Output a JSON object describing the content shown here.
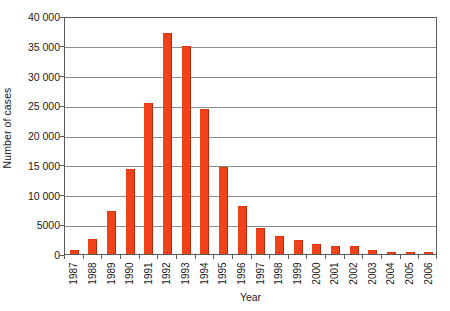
{
  "chart_data": {
    "type": "bar",
    "title": "",
    "xlabel": "Year",
    "ylabel": "Number of cases",
    "categories": [
      "1987",
      "1988",
      "1989",
      "1990",
      "1991",
      "1992",
      "1993",
      "1994",
      "1995",
      "1996",
      "1997",
      "1998",
      "1999",
      "2000",
      "2001",
      "2002",
      "2003",
      "2004",
      "2005",
      "2006"
    ],
    "values": [
      600,
      2500,
      7200,
      14300,
      25300,
      37200,
      35000,
      24400,
      14600,
      8000,
      4300,
      3000,
      2300,
      1600,
      1400,
      1300,
      700,
      400,
      250,
      120
    ],
    "series": [
      {
        "name": "Number of cases",
        "values": [
          600,
          2500,
          7200,
          14300,
          25300,
          37200,
          35000,
          24400,
          14600,
          8000,
          4300,
          3000,
          2300,
          1600,
          1400,
          1300,
          700,
          400,
          250,
          120
        ]
      }
    ],
    "ylim": [
      0,
      40000
    ],
    "ytick_values": [
      0,
      5000,
      10000,
      15000,
      20000,
      25000,
      30000,
      35000,
      40000
    ],
    "ytick_labels": [
      "0",
      "5000",
      "10 000",
      "15 000",
      "20 000",
      "25 000",
      "30 000",
      "35 000",
      "40 000"
    ],
    "grid": true,
    "grid_axis": "y",
    "legend": false,
    "legend_position": "none",
    "bar_color": "#f0421a",
    "bar_edge_color": "#b52a0c",
    "gridline_color": "#8c8c8c",
    "axis_color": "#5a5a5a",
    "background_color": "#ffffff",
    "text_color": "#1a1a1a",
    "xtick_label_rotation": 90
  }
}
